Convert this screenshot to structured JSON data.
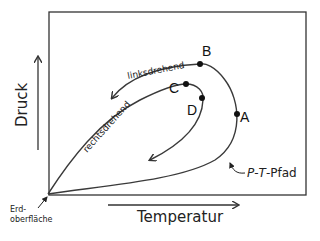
{
  "diagram": {
    "axes": {
      "y_label": "Druck",
      "x_label": "Temperatur"
    },
    "origin_label_line1": "Erd-",
    "origin_label_line2": "oberfläche",
    "points": {
      "A": "A",
      "B": "B",
      "C": "C",
      "D": "D"
    },
    "path_labels": {
      "counterclockwise": "linksdrehend",
      "clockwise": "rechtsdrehend"
    },
    "pt_path_label": {
      "p": "P",
      "dash1": "-",
      "t": "T",
      "rest": "-Pfad"
    },
    "colors": {
      "line": "#3a3a3a",
      "frame": "#333333",
      "background": "#ffffff"
    }
  }
}
